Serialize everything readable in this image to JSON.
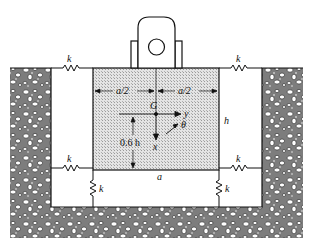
{
  "diagram": {
    "type": "spring-supported block in pit",
    "labels": {
      "spring_top_left": "k",
      "spring_top_right": "k",
      "spring_bottom_left_h": "k",
      "spring_bottom_right_h": "k",
      "spring_vertical_left": "k",
      "spring_vertical_right": "k",
      "half_width_left": "a/2",
      "half_width_right": "a/2",
      "center_of_gravity": "G",
      "axis_y": "y",
      "axis_x": "x",
      "rotation": "θ",
      "height": "h",
      "cg_height": "0.6 h",
      "width": "a"
    },
    "colors": {
      "block_fill": "#d9d9d9",
      "soil_fill": "#8a8a8a",
      "line": "#111111",
      "background": "#ffffff"
    }
  }
}
